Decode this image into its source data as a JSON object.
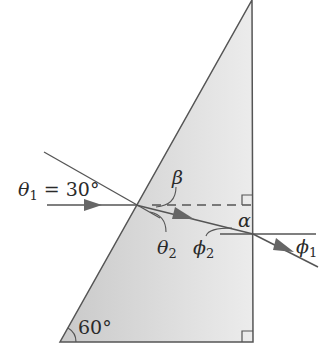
{
  "figure": {
    "type": "prism-refraction-diagram",
    "prism_fill": "#d9d9d9",
    "line_color": "#555555",
    "labels": {
      "theta1": {
        "symbol": "θ",
        "sub": "1",
        "value": " = 30°"
      },
      "beta": {
        "symbol": "β"
      },
      "theta2": {
        "symbol": "θ",
        "sub": "2"
      },
      "phi2": {
        "symbol": "ϕ",
        "sub": "2"
      },
      "alpha": {
        "symbol": "α"
      },
      "phi1": {
        "symbol": "ϕ",
        "sub": "1"
      },
      "apex_angle": "60°"
    }
  }
}
